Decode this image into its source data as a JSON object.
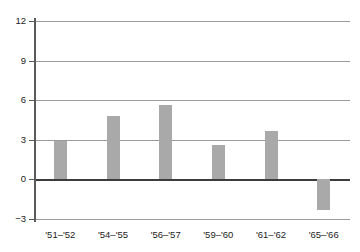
{
  "chart_data": {
    "type": "bar",
    "title": "",
    "xlabel": "",
    "ylabel": "",
    "categories": [
      "'51–'52",
      "'54–'55",
      "'56–'57",
      "'59–'60",
      "'61–'62",
      "'65–'66"
    ],
    "values": [
      2.9,
      4.8,
      5.6,
      2.6,
      3.7,
      -2.3
    ],
    "ylim": [
      -3,
      12
    ],
    "yticks": [
      12,
      9,
      6,
      3,
      0,
      -3
    ],
    "ytick_labels": [
      "12",
      "9",
      "6",
      "3",
      "0",
      "−3"
    ],
    "grid": true,
    "legend": "none",
    "bar_color": "#a9a9a9",
    "gridline_color": "#9a9a9a",
    "zero_line_color": "#3c3c3c",
    "axis_color": "#5a5a5a",
    "background": "#ffffff"
  },
  "axes": {
    "y_axis_name": "y-axis",
    "x_axis_name": "x-axis"
  }
}
